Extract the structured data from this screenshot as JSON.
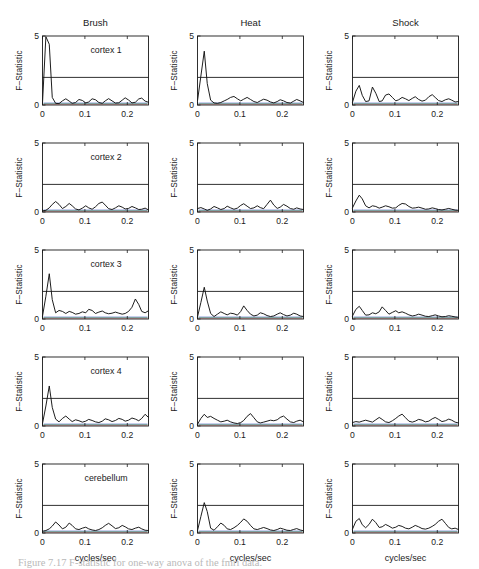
{
  "figure": {
    "columns": [
      "Brush",
      "Heat",
      "Shock"
    ],
    "rows": [
      "cortex 1",
      "cortex 2",
      "cortex 3",
      "cortex 4",
      "cerebellum"
    ],
    "ylabel": "F-Statistic",
    "xlabel": "cycles/sec",
    "yticks": [
      "0",
      "5"
    ],
    "xticks": [
      "0",
      "0.1",
      "0.2"
    ],
    "caption": "Figure 7.17  F-statistic for one-way anova of the fmri data."
  },
  "chart_data": {
    "type": "line",
    "title": "",
    "xlabel": "cycles/sec",
    "ylabel": "F-Statistic",
    "xlim": [
      0,
      0.25
    ],
    "ylim": [
      0,
      5
    ],
    "xticks": [
      0,
      0.1,
      0.2
    ],
    "yticks": [
      0,
      5
    ],
    "grid": false,
    "legend": "none",
    "threshold": 2.0,
    "threshold_label": "critical F value",
    "columns": [
      "Brush",
      "Heat",
      "Shock"
    ],
    "rows": [
      "cortex 1",
      "cortex 2",
      "cortex 3",
      "cortex 4",
      "cerebellum"
    ],
    "x": [
      0.0,
      0.008,
      0.016,
      0.023,
      0.031,
      0.039,
      0.047,
      0.055,
      0.063,
      0.07,
      0.078,
      0.086,
      0.094,
      0.102,
      0.109,
      0.117,
      0.125,
      0.133,
      0.141,
      0.148,
      0.156,
      0.164,
      0.172,
      0.18,
      0.188,
      0.195,
      0.203,
      0.211,
      0.219,
      0.227,
      0.234,
      0.242,
      0.25
    ],
    "panels": [
      {
        "row": "cortex 1",
        "column": "Brush",
        "peak_value": 5.0,
        "peak_freq": 0.012,
        "crosses_threshold": true,
        "values": [
          0.15,
          4.95,
          4.4,
          0.55,
          0.12,
          0.1,
          0.3,
          0.45,
          0.28,
          0.12,
          0.18,
          0.4,
          0.33,
          0.15,
          0.22,
          0.45,
          0.38,
          0.18,
          0.12,
          0.3,
          0.46,
          0.3,
          0.14,
          0.16,
          0.35,
          0.52,
          0.36,
          0.15,
          0.2,
          0.44,
          0.5,
          0.28,
          0.2
        ]
      },
      {
        "row": "cortex 1",
        "column": "Heat",
        "peak_value": 3.95,
        "peak_freq": 0.014,
        "crosses_threshold": true,
        "values": [
          0.3,
          2.1,
          3.9,
          1.55,
          0.35,
          0.15,
          0.12,
          0.18,
          0.3,
          0.4,
          0.55,
          0.62,
          0.45,
          0.3,
          0.42,
          0.55,
          0.4,
          0.25,
          0.18,
          0.3,
          0.42,
          0.35,
          0.22,
          0.15,
          0.25,
          0.38,
          0.3,
          0.18,
          0.14,
          0.28,
          0.4,
          0.3,
          0.18
        ]
      },
      {
        "row": "cortex 1",
        "column": "Shock",
        "peak_value": 1.45,
        "peak_freq": 0.012,
        "crosses_threshold": false,
        "values": [
          0.2,
          1.0,
          1.42,
          0.7,
          0.25,
          0.3,
          1.3,
          0.85,
          0.25,
          0.3,
          0.72,
          0.8,
          0.55,
          0.3,
          0.38,
          0.55,
          0.45,
          0.32,
          0.48,
          0.6,
          0.4,
          0.28,
          0.35,
          0.6,
          0.75,
          0.55,
          0.32,
          0.25,
          0.38,
          0.45,
          0.35,
          0.22,
          0.25
        ]
      },
      {
        "row": "cortex 2",
        "column": "Brush",
        "peak_value": 0.78,
        "peak_freq": 0.039,
        "crosses_threshold": false,
        "values": [
          0.08,
          0.12,
          0.3,
          0.55,
          0.76,
          0.55,
          0.25,
          0.4,
          0.62,
          0.45,
          0.22,
          0.15,
          0.28,
          0.45,
          0.3,
          0.2,
          0.38,
          0.62,
          0.72,
          0.5,
          0.24,
          0.18,
          0.3,
          0.45,
          0.35,
          0.22,
          0.26,
          0.4,
          0.3,
          0.18,
          0.2,
          0.28,
          0.15
        ]
      },
      {
        "row": "cortex 2",
        "column": "Heat",
        "peak_value": 0.88,
        "peak_freq": 0.18,
        "crosses_threshold": false,
        "values": [
          0.25,
          0.32,
          0.22,
          0.12,
          0.22,
          0.4,
          0.3,
          0.18,
          0.25,
          0.42,
          0.3,
          0.2,
          0.28,
          0.48,
          0.6,
          0.42,
          0.25,
          0.3,
          0.45,
          0.32,
          0.24,
          0.55,
          0.86,
          0.5,
          0.26,
          0.35,
          0.55,
          0.42,
          0.25,
          0.2,
          0.3,
          0.22,
          0.18
        ]
      },
      {
        "row": "cortex 2",
        "column": "Shock",
        "peak_value": 1.25,
        "peak_freq": 0.016,
        "crosses_threshold": false,
        "values": [
          0.3,
          0.8,
          1.22,
          0.95,
          0.45,
          0.3,
          0.45,
          0.4,
          0.28,
          0.35,
          0.45,
          0.38,
          0.28,
          0.3,
          0.48,
          0.62,
          0.58,
          0.4,
          0.28,
          0.3,
          0.35,
          0.28,
          0.2,
          0.22,
          0.3,
          0.25,
          0.18,
          0.15,
          0.2,
          0.26,
          0.2,
          0.14,
          0.12
        ]
      },
      {
        "row": "cortex 3",
        "column": "Brush",
        "peak_value": 3.3,
        "peak_freq": 0.014,
        "crosses_threshold": true,
        "values": [
          0.2,
          1.65,
          3.28,
          1.4,
          0.45,
          0.62,
          0.55,
          0.4,
          0.55,
          0.48,
          0.35,
          0.4,
          0.52,
          0.45,
          0.7,
          0.62,
          0.4,
          0.5,
          0.58,
          0.45,
          0.38,
          0.42,
          0.5,
          0.42,
          0.35,
          0.4,
          0.55,
          0.85,
          1.45,
          1.05,
          0.55,
          0.45,
          0.6
        ]
      },
      {
        "row": "cortex 3",
        "column": "Heat",
        "peak_value": 2.32,
        "peak_freq": 0.016,
        "crosses_threshold": true,
        "values": [
          0.15,
          1.2,
          2.3,
          1.3,
          0.4,
          0.18,
          0.35,
          0.52,
          0.4,
          0.3,
          0.42,
          0.38,
          0.28,
          0.55,
          0.95,
          0.62,
          0.35,
          0.22,
          0.28,
          0.45,
          0.38,
          0.25,
          0.18,
          0.22,
          0.35,
          0.45,
          0.32,
          0.22,
          0.28,
          0.42,
          0.35,
          0.22,
          0.18
        ]
      },
      {
        "row": "cortex 3",
        "column": "Shock",
        "peak_value": 0.95,
        "peak_freq": 0.016,
        "crosses_threshold": false,
        "values": [
          0.22,
          0.7,
          0.92,
          0.62,
          0.28,
          0.3,
          0.45,
          0.38,
          0.52,
          0.88,
          0.62,
          0.35,
          0.48,
          0.6,
          0.45,
          0.52,
          0.42,
          0.3,
          0.22,
          0.26,
          0.35,
          0.28,
          0.2,
          0.18,
          0.24,
          0.3,
          0.22,
          0.16,
          0.18,
          0.24,
          0.2,
          0.15,
          0.12
        ]
      },
      {
        "row": "cortex 4",
        "column": "Brush",
        "peak_value": 2.92,
        "peak_freq": 0.014,
        "crosses_threshold": true,
        "values": [
          0.18,
          1.45,
          2.9,
          1.35,
          0.5,
          0.3,
          0.55,
          0.72,
          0.5,
          0.32,
          0.45,
          0.38,
          0.28,
          0.35,
          0.48,
          0.4,
          0.3,
          0.25,
          0.35,
          0.52,
          0.45,
          0.32,
          0.4,
          0.55,
          0.48,
          0.35,
          0.42,
          0.58,
          0.5,
          0.38,
          0.55,
          0.85,
          0.62
        ]
      },
      {
        "row": "cortex 4",
        "column": "Heat",
        "peak_value": 0.92,
        "peak_freq": 0.125,
        "crosses_threshold": false,
        "values": [
          0.12,
          0.55,
          0.85,
          0.62,
          0.7,
          0.55,
          0.42,
          0.3,
          0.35,
          0.42,
          0.3,
          0.22,
          0.18,
          0.25,
          0.4,
          0.7,
          0.9,
          0.6,
          0.3,
          0.22,
          0.28,
          0.35,
          0.42,
          0.38,
          0.45,
          0.62,
          0.72,
          0.5,
          0.3,
          0.25,
          0.35,
          0.42,
          0.3
        ]
      },
      {
        "row": "cortex 4",
        "column": "Shock",
        "peak_value": 0.88,
        "peak_freq": 0.133,
        "crosses_threshold": false,
        "values": [
          0.25,
          0.32,
          0.28,
          0.35,
          0.42,
          0.35,
          0.28,
          0.45,
          0.62,
          0.48,
          0.3,
          0.25,
          0.38,
          0.55,
          0.72,
          0.86,
          0.6,
          0.35,
          0.28,
          0.35,
          0.48,
          0.42,
          0.3,
          0.35,
          0.52,
          0.62,
          0.48,
          0.32,
          0.38,
          0.5,
          0.42,
          0.28,
          0.22
        ]
      },
      {
        "row": "cerebellum",
        "column": "Brush",
        "peak_value": 0.82,
        "peak_freq": 0.039,
        "crosses_threshold": false,
        "values": [
          0.12,
          0.18,
          0.3,
          0.5,
          0.8,
          0.58,
          0.3,
          0.42,
          0.72,
          0.55,
          0.3,
          0.25,
          0.35,
          0.42,
          0.3,
          0.22,
          0.18,
          0.25,
          0.38,
          0.55,
          0.7,
          0.52,
          0.32,
          0.38,
          0.55,
          0.45,
          0.3,
          0.25,
          0.35,
          0.42,
          0.3,
          0.2,
          0.18
        ]
      },
      {
        "row": "cerebellum",
        "column": "Heat",
        "peak_value": 2.22,
        "peak_freq": 0.014,
        "crosses_threshold": true,
        "values": [
          0.18,
          1.2,
          2.2,
          1.55,
          0.35,
          0.2,
          0.45,
          0.72,
          0.55,
          0.3,
          0.25,
          0.38,
          0.55,
          0.78,
          1.02,
          0.85,
          0.55,
          0.3,
          0.25,
          0.32,
          0.4,
          0.32,
          0.22,
          0.18,
          0.25,
          0.35,
          0.28,
          0.2,
          0.18,
          0.26,
          0.32,
          0.22,
          0.16
        ]
      },
      {
        "row": "cerebellum",
        "column": "Shock",
        "peak_value": 1.08,
        "peak_freq": 0.012,
        "crosses_threshold": false,
        "values": [
          0.28,
          0.85,
          1.05,
          0.6,
          0.38,
          0.62,
          1.0,
          0.75,
          0.4,
          0.45,
          0.62,
          0.5,
          0.35,
          0.42,
          0.55,
          0.48,
          0.35,
          0.3,
          0.42,
          0.55,
          0.45,
          0.32,
          0.28,
          0.35,
          0.48,
          0.62,
          0.85,
          1.0,
          0.7,
          0.4,
          0.3,
          0.35,
          0.25
        ]
      }
    ]
  }
}
